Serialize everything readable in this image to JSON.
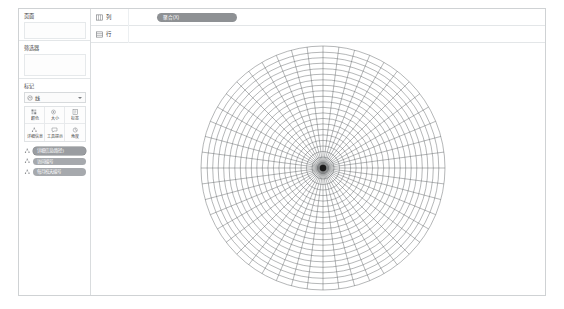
{
  "window": {
    "title": "",
    "background": "#ffffff",
    "border_color": "#cfd2d4"
  },
  "sidebar": {
    "cards": [
      {
        "title": "页面",
        "name": "pages-card"
      },
      {
        "title": "筛选器",
        "name": "filters-card"
      }
    ],
    "marks": {
      "title": "标记",
      "mark_type": "线",
      "mark_type_icon": "line-mark-icon",
      "buttons": [
        {
          "label": "颜色",
          "icon": "color-icon"
        },
        {
          "label": "大小",
          "icon": "size-icon"
        },
        {
          "label": "标签",
          "icon": "label-icon"
        },
        {
          "label": "详细信息",
          "icon": "detail-icon"
        },
        {
          "label": "工具提示",
          "icon": "tooltip-icon"
        },
        {
          "label": "角度",
          "icon": "angle-icon"
        }
      ],
      "pills": [
        {
          "label": "详细信息(路径)",
          "icon": "detail-icon",
          "selected": true
        },
        {
          "label": "访问编号",
          "icon": "detail-icon",
          "selected": false
        },
        {
          "label": "每月校天编号",
          "icon": "detail-icon",
          "selected": false
        }
      ]
    }
  },
  "shelves": [
    {
      "label": "列",
      "icon": "columns-icon",
      "name": "columns-shelf",
      "pill": {
        "label": "聚合(X)",
        "color": "#8e9194"
      }
    },
    {
      "label": "行",
      "icon": "rows-icon",
      "name": "rows-shelf",
      "pill": null
    }
  ],
  "chart_data": {
    "type": "line",
    "title": "",
    "subtitle": "",
    "xlabel": "",
    "ylabel": "",
    "center": {
      "x": 322,
      "y": 167
    },
    "outer_radius": 122,
    "ring_count": 22,
    "spoke_count": 48,
    "angle_start_deg": 0,
    "angle_end_deg": 360,
    "grid": true,
    "legend": false,
    "line_color": "#5a5d61",
    "line_width": 0.45,
    "center_dot_color": "#1a1a1a",
    "center_dot_radius": 3.2,
    "radii": [
      5.5,
      11,
      16.5,
      22,
      27.6,
      33.1,
      38.6,
      44.1,
      49.6,
      55.1,
      60.7,
      66.2,
      71.7,
      77.2,
      82.7,
      88.2,
      93.8,
      99.3,
      104.8,
      110.3,
      115.8,
      122
    ],
    "series": [
      {
        "name": "radial-grid-spokes",
        "values": [
          122,
          122,
          122,
          122,
          122,
          122,
          122,
          122,
          122,
          122,
          122,
          122,
          122,
          122,
          122,
          122,
          122,
          122,
          122,
          122,
          122,
          122,
          122,
          122,
          122,
          122,
          122,
          122,
          122,
          122,
          122,
          122,
          122,
          122,
          122,
          122,
          122,
          122,
          122,
          122,
          122,
          122,
          122,
          122,
          122,
          122,
          122,
          122
        ]
      }
    ]
  }
}
